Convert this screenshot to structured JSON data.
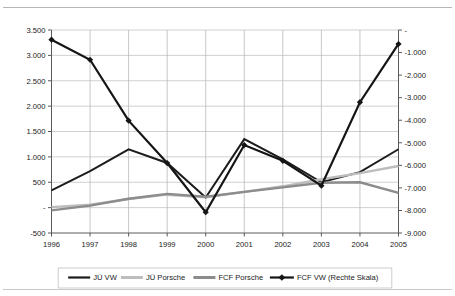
{
  "chart_data": {
    "type": "line",
    "title": "",
    "subtitle": "",
    "xlabel": "",
    "ylabel": "",
    "y2label": "",
    "grid": true,
    "legend_position": "bottom",
    "categories": [
      "1996",
      "1997",
      "1998",
      "1999",
      "2000",
      "2001",
      "2002",
      "2003",
      "2004",
      "2005"
    ],
    "left_axis": {
      "ticks": [
        "-500",
        "-",
        "500",
        "1.000",
        "1.500",
        "2.000",
        "2.500",
        "3.000",
        "3.500"
      ],
      "values": [
        -500,
        0,
        500,
        1000,
        1500,
        2000,
        2500,
        3000,
        3500
      ],
      "ylim": [
        -500,
        3500
      ]
    },
    "right_axis": {
      "ticks": [
        "-9.000",
        "-8.000",
        "-7.000",
        "-6.000",
        "-5.000",
        "-4.000",
        "-3.000",
        "-2.000",
        "-1.000",
        "-"
      ],
      "values": [
        -9000,
        -8000,
        -7000,
        -6000,
        -5000,
        -4000,
        -3000,
        -2000,
        -1000,
        0
      ],
      "ylim": [
        -9000,
        0
      ]
    },
    "series": [
      {
        "name": "JÜ VW",
        "axis": "left",
        "color": "#1c1c1c",
        "width": 2.0,
        "marker": "none",
        "values": [
          340,
          720,
          1150,
          880,
          200,
          1350,
          950,
          500,
          700,
          1150
        ]
      },
      {
        "name": "JÜ Porsche",
        "axis": "left",
        "color": "#bdbdbd",
        "width": 2.4,
        "marker": "none",
        "values": [
          10,
          60,
          170,
          255,
          205,
          310,
          420,
          560,
          680,
          820
        ]
      },
      {
        "name": "FCF Porsche",
        "axis": "left",
        "color": "#8c8c8c",
        "width": 2.4,
        "marker": "none",
        "values": [
          -55,
          40,
          175,
          270,
          215,
          310,
          400,
          490,
          500,
          290
        ]
      },
      {
        "name": "FCF VW (Rechte Skala)",
        "axis": "right",
        "color": "#151515",
        "width": 2.2,
        "marker": "diamond",
        "values": [
          -430,
          -1320,
          -4020,
          -5900,
          -8080,
          -5100,
          -5800,
          -6900,
          -3200,
          -620
        ]
      }
    ]
  },
  "legend": {
    "items": [
      {
        "label": "JÜ VW",
        "swatch": "#1c1c1c",
        "marker": "none"
      },
      {
        "label": "JÜ Porsche",
        "swatch": "#bdbdbd",
        "marker": "none"
      },
      {
        "label": "FCF Porsche",
        "swatch": "#8c8c8c",
        "marker": "none"
      },
      {
        "label": "FCF VW (Rechte Skala)",
        "swatch": "#151515",
        "marker": "diamond"
      }
    ]
  }
}
